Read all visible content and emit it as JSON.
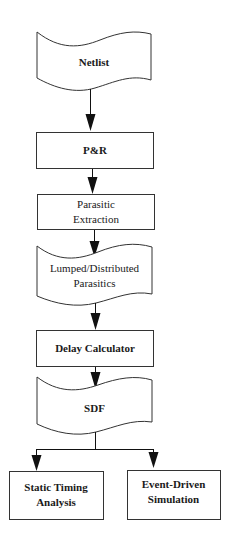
{
  "diagram": {
    "type": "flowchart",
    "nodes": [
      {
        "id": "netlist",
        "shape": "document",
        "label": "Netlist"
      },
      {
        "id": "pr",
        "shape": "process",
        "label": "P&R"
      },
      {
        "id": "extraction",
        "shape": "process",
        "label_lines": [
          "Parasitic",
          "Extraction"
        ]
      },
      {
        "id": "parasitics",
        "shape": "document",
        "label_lines": [
          "Lumped/Distributed",
          "Parasitics"
        ]
      },
      {
        "id": "delay",
        "shape": "process",
        "label": "Delay Calculator"
      },
      {
        "id": "sdf",
        "shape": "document",
        "label": "SDF"
      },
      {
        "id": "sta",
        "shape": "process",
        "label_lines": [
          "Static Timing",
          "Analysis"
        ]
      },
      {
        "id": "sim",
        "shape": "process",
        "label_lines": [
          "Event-Driven",
          "Simulation"
        ]
      }
    ],
    "edges": [
      {
        "from": "netlist",
        "to": "pr"
      },
      {
        "from": "pr",
        "to": "extraction"
      },
      {
        "from": "extraction",
        "to": "parasitics"
      },
      {
        "from": "parasitics",
        "to": "delay"
      },
      {
        "from": "delay",
        "to": "sdf"
      },
      {
        "from": "sdf",
        "to": "sta"
      },
      {
        "from": "sdf",
        "to": "sim"
      }
    ],
    "colors": {
      "stroke": "#333333",
      "fill": "#ffffff",
      "text": "#1a1a1a"
    }
  }
}
